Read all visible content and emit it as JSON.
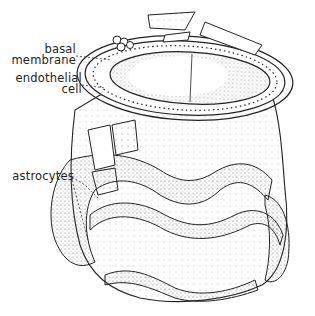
{
  "figure": {
    "labels": {
      "basal_membrane_line1": "basal",
      "basal_membrane_line2": "membrane",
      "endothelial_line1": "endothelial",
      "endothelial_line2": "cell",
      "astrocytes": "astrocytes"
    }
  }
}
